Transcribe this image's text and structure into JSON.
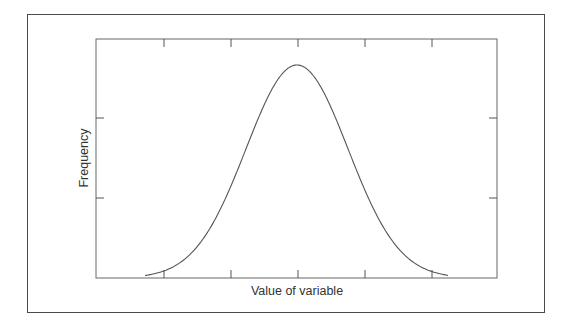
{
  "chart_data": {
    "type": "line",
    "title": "",
    "xlabel": "Value of variable",
    "ylabel": "Frequency",
    "distribution": {
      "shape": "normal",
      "mean_tick_index": 2,
      "sigma_in_tick_units": 0.77
    },
    "x_ticks": [
      "",
      "",
      "",
      "",
      ""
    ],
    "y_ticks": [
      "",
      ""
    ],
    "tick_labels_shown": false,
    "grid": false,
    "legend": null,
    "xlim": [
      -3,
      3
    ],
    "ylim": [
      0,
      1.12
    ],
    "series": [
      {
        "name": "distribution",
        "x": [
          -2.2,
          -2.0,
          -1.5,
          -1.0,
          -0.5,
          0.0,
          0.5,
          1.0,
          1.5,
          2.0,
          2.2
        ],
        "values": [
          0.02,
          0.05,
          0.15,
          0.43,
          0.81,
          1.0,
          0.81,
          0.43,
          0.15,
          0.05,
          0.02
        ]
      }
    ],
    "colors": {
      "line": "#555555",
      "axes": "#555555",
      "frame": "#4a4a4a"
    }
  }
}
